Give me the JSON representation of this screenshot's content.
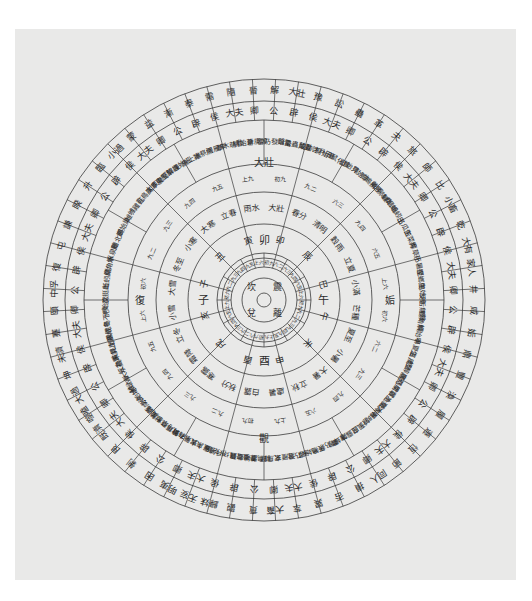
{
  "panel": {
    "background": "#e9e9e8",
    "line_color": "#3a3a3a",
    "text_color": "#2b2b2b"
  },
  "diagram": {
    "center": {
      "x": 264,
      "y": 300
    },
    "radii": [
      7,
      22,
      33,
      42,
      47,
      76,
      108,
      136,
      180,
      199,
      221
    ],
    "core": {
      "trigrams": [
        "坎",
        "震",
        "離",
        "兌"
      ]
    },
    "rings": [
      {
        "name": "hexagram-outer",
        "r_inner": 199,
        "r_outer": 221,
        "font": 9,
        "start_deg": -90,
        "labels": [
          "解",
          "大壯",
          "豫",
          "訟",
          "蠱",
          "革",
          "夬",
          "旅",
          "師",
          "比",
          "小畜",
          "乾",
          "大有",
          "家人",
          "井",
          "咸",
          "姤",
          "鼎",
          "豐",
          "渙",
          "履",
          "遯",
          "恆",
          "節",
          "同人",
          "損",
          "否",
          "巽",
          "萃",
          "大畜",
          "賁",
          "觀",
          "歸妹",
          "无妄",
          "明夷",
          "困",
          "剝",
          "艮",
          "既濟",
          "噬嗑",
          "大過",
          "坤",
          "未濟",
          "蹇",
          "頤",
          "中孚",
          "復",
          "屯",
          "謙",
          "睽",
          "升",
          "臨",
          "小過",
          "蒙",
          "益",
          "漸",
          "泰",
          "需",
          "隨",
          "晉"
        ]
      },
      {
        "name": "rank-ring",
        "r_inner": 180,
        "r_outer": 199,
        "font": 9,
        "start_deg": -90,
        "labels": [
          "公",
          "辟",
          "侯",
          "大夫",
          "卿",
          "公",
          "辟",
          "侯",
          "大夫",
          "卿",
          "公",
          "辟",
          "侯",
          "大夫",
          "卿",
          "公",
          "辟",
          "侯",
          "大夫",
          "卿",
          "公",
          "辟",
          "侯",
          "大夫",
          "卿",
          "公",
          "辟",
          "侯",
          "大夫",
          "卿",
          "公",
          "辟",
          "侯",
          "大夫",
          "卿",
          "公",
          "辟",
          "侯",
          "大夫",
          "卿",
          "公",
          "辟",
          "侯",
          "大夫",
          "卿",
          "公",
          "辟",
          "侯",
          "大夫",
          "卿",
          "公",
          "辟",
          "侯",
          "大夫",
          "卿",
          "公",
          "辟",
          "侯",
          "大夫",
          "卿"
        ]
      },
      {
        "name": "phenology-ring",
        "r_inner": 136,
        "r_outer": 180,
        "font": 7,
        "start_deg": -90,
        "labels": [
          "雷乃發聲",
          "始電",
          "蟄蟲咸動",
          "蟄蟲啓戶",
          "桐始華",
          "田鼠化鴽",
          "虹始見",
          "萍始生",
          "鳴鳩拂羽",
          "戴勝降桑",
          "螻蟈鳴",
          "蚯蚓出",
          "王瓜生",
          "苦菜秀",
          "靡草死",
          "小暑至",
          "螳螂生",
          "鵙始鳴",
          "反舌無聲",
          "鹿角解",
          "蜩始鳴",
          "半夏生",
          "溫風至",
          "蟋蟀居壁",
          "鷹乃學習",
          "腐草為螢",
          "土潤溽暑",
          "大雨時行",
          "涼風至",
          "白露降",
          "寒蟬鳴",
          "鷹乃祭鳥",
          "天地始肅",
          "禾乃登",
          "鴻雁來",
          "玄鳥歸",
          "群鳥養羞",
          "雷始收聲",
          "蟄蟲坏戶",
          "水始涸",
          "鴻雁來賓",
          "雀入大水為蛤",
          "菊有黃華",
          "豺乃祭獸",
          "草木黃落",
          "蟄蟲咸俯",
          "水始冰",
          "地始凍",
          "雉入大水為蜃",
          "虹藏不見",
          "天氣上騰",
          "閉塞成冬",
          "鶡鳥不鳴",
          "虎始交",
          "荔挺出",
          "蚯蚓結",
          "麋角解",
          "水泉動",
          "雁北鄉",
          "鵲始巢",
          "雉雊",
          "雞乳",
          "征鳥厲疾",
          "水澤腹堅",
          "東風解凍",
          "蟄蟲始振",
          "魚上冰",
          "獺祭魚",
          "鴻雁來",
          "草木萌動",
          "桃始華",
          "倉庚鳴"
        ]
      },
      {
        "name": "line-ring",
        "r_inner": 108,
        "r_outer": 136,
        "font": 6,
        "start_deg": -90,
        "labels": [
          "初九",
          "九二",
          "六三",
          "九四",
          "六五",
          "上六",
          "初六",
          "六二",
          "九三",
          "九四",
          "六五",
          "上九",
          "初九",
          "九二",
          "九三",
          "九四",
          "九五",
          "上六",
          "初六",
          "九二",
          "九三",
          "九四",
          "九五",
          "上九"
        ]
      },
      {
        "name": "solar-term-ring",
        "r_inner": 76,
        "r_outer": 108,
        "font": 8,
        "start_deg": -90,
        "labels": [
          "大壯",
          "春分",
          "清明",
          "穀雨",
          "立夏",
          "小滿",
          "芒種",
          "夏至",
          "小暑",
          "大暑",
          "立秋",
          "處暑",
          "白露",
          "秋分",
          "寒露",
          "霜降",
          "立冬",
          "小雪",
          "大雪",
          "冬至",
          "小寒",
          "大寒",
          "立春",
          "雨水"
        ]
      },
      {
        "name": "branch-ring",
        "r_inner": 47,
        "r_outer": 76,
        "font": 9,
        "start_deg": -90,
        "labels": [
          "卯",
          "辰",
          "巳",
          "午",
          "未",
          "申",
          "酉",
          "戌",
          "亥",
          "子",
          "丑",
          "寅"
        ]
      },
      {
        "name": "inner-line-ring",
        "r_inner": 33,
        "r_outer": 42,
        "font": 5,
        "start_deg": -90,
        "labels": [
          "初九",
          "六二",
          "六三",
          "九四",
          "六五",
          "上六",
          "初九",
          "九二",
          "九三",
          "九四",
          "九五",
          "上九",
          "初六",
          "六二",
          "六三",
          "九四",
          "六五",
          "上九",
          "初六",
          "九二",
          "九三",
          "九四",
          "九五",
          "上六"
        ]
      }
    ],
    "mid_labels": {
      "top": "卯",
      "right": "午",
      "bottom": "酉",
      "left": "子",
      "top_hex": "大壯",
      "right_hex": "姤",
      "bottom_hex": "觀",
      "left_hex": "復"
    },
    "dividers": [
      {
        "r_from": 47,
        "r_to": 136,
        "count": 12,
        "offset_deg": -75
      },
      {
        "r_from": 136,
        "r_to": 180,
        "count": 24,
        "offset_deg": -90
      },
      {
        "r_from": 180,
        "r_to": 221,
        "count": 60,
        "offset_deg": -93
      },
      {
        "r_from": 33,
        "r_to": 47,
        "count": 24,
        "offset_deg": -90
      }
    ]
  }
}
